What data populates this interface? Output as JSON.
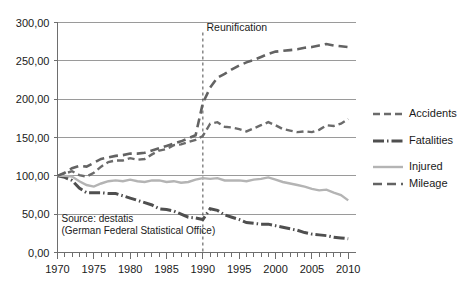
{
  "chart_data": {
    "type": "line",
    "title": "",
    "xlabel": "",
    "ylabel": "",
    "xlim": [
      1970,
      2011
    ],
    "ylim": [
      0,
      300
    ],
    "grid": true,
    "legend_position": "right",
    "y_ticks": [
      "0,00",
      "50,00",
      "100,00",
      "150,00",
      "200,00",
      "250,00",
      "300,00"
    ],
    "y_tick_values": [
      0,
      50,
      100,
      150,
      200,
      250,
      300
    ],
    "x_ticks": [
      "1970",
      "1975",
      "1980",
      "1985",
      "1990",
      "1995",
      "2000",
      "2005",
      "2010"
    ],
    "x_tick_values": [
      1970,
      1975,
      1980,
      1985,
      1990,
      1995,
      2000,
      2005,
      2010
    ],
    "x": [
      1970,
      1971,
      1972,
      1973,
      1974,
      1975,
      1976,
      1977,
      1978,
      1979,
      1980,
      1981,
      1982,
      1983,
      1984,
      1985,
      1986,
      1987,
      1988,
      1989,
      1990,
      1991,
      1992,
      1993,
      1994,
      1995,
      1996,
      1997,
      1998,
      1999,
      2000,
      2001,
      2002,
      2003,
      2004,
      2005,
      2006,
      2007,
      2008,
      2009,
      2010
    ],
    "series": [
      {
        "name": "Accidents",
        "style": "dashed",
        "color": "#6b6b6b",
        "values": [
          100,
          103,
          106,
          101,
          99,
          104,
          112,
          118,
          120,
          120,
          123,
          121,
          122,
          128,
          133,
          135,
          140,
          141,
          144,
          147,
          152,
          168,
          170,
          164,
          163,
          161,
          158,
          162,
          166,
          170,
          166,
          161,
          159,
          157,
          158,
          157,
          160,
          166,
          165,
          168,
          174
        ],
        "annotations": []
      },
      {
        "name": "Fatalities",
        "style": "dashdot",
        "color": "#4f4f4f",
        "values": [
          100,
          98,
          94,
          84,
          78,
          78,
          78,
          77,
          77,
          74,
          71,
          68,
          65,
          62,
          57,
          56,
          54,
          50,
          46,
          45,
          43,
          57,
          55,
          49,
          46,
          43,
          39,
          38,
          37,
          37,
          35,
          33,
          31,
          29,
          26,
          24,
          23,
          22,
          20,
          19,
          18
        ],
        "annotations": []
      },
      {
        "name": "Injured",
        "style": "solid",
        "color": "#b4b4b4",
        "values": [
          100,
          100,
          99,
          93,
          88,
          86,
          90,
          93,
          94,
          93,
          95,
          93,
          92,
          94,
          94,
          92,
          93,
          91,
          92,
          95,
          97,
          96,
          97,
          94,
          94,
          94,
          93,
          95,
          96,
          98,
          95,
          92,
          90,
          88,
          86,
          83,
          81,
          82,
          78,
          75,
          68
        ],
        "annotations": []
      },
      {
        "name": "Mileage",
        "style": "longdash",
        "color": "#636363",
        "values": [
          100,
          104,
          110,
          113,
          112,
          117,
          122,
          124,
          126,
          127,
          129,
          129,
          130,
          133,
          136,
          139,
          142,
          145,
          149,
          153,
          195,
          215,
          228,
          233,
          239,
          244,
          248,
          251,
          255,
          259,
          262,
          263,
          264,
          265,
          267,
          268,
          270,
          272,
          270,
          269,
          268
        ],
        "annotations": []
      }
    ],
    "annotations": [
      {
        "name": "reunification-marker",
        "label": "Reunification",
        "x_value": 1990,
        "style": "vertical-dashed-line"
      }
    ],
    "source_lines": [
      "Source: destatis",
      "(German Federal Statistical Office)"
    ]
  },
  "legend": {
    "items": [
      {
        "label": "Accidents"
      },
      {
        "label": "Fatalities"
      },
      {
        "label": "Injured"
      },
      {
        "label": "Mileage"
      }
    ]
  }
}
